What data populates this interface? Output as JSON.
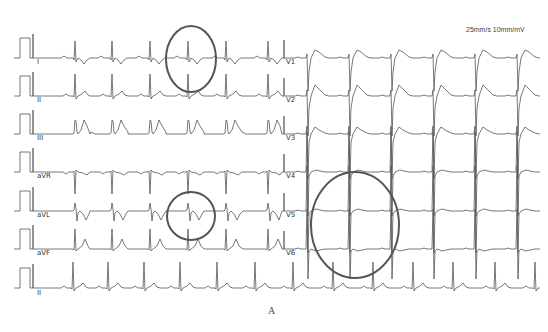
{
  "header": {
    "speed_label": "25mm/s 10mm/mV"
  },
  "figure": {
    "panel_label": "A"
  },
  "colors": {
    "trace": "#555555",
    "circle": "#555555",
    "background": "#ffffff"
  },
  "limb_leads": [
    {
      "name": "I",
      "baseline": 58,
      "label_x": 37,
      "label_y": 62,
      "morph": "I"
    },
    {
      "name": "II",
      "baseline": 96,
      "label_x": 37,
      "label_y": 100,
      "morph": "II"
    },
    {
      "name": "III",
      "baseline": 134,
      "label_x": 37,
      "label_y": 138,
      "morph": "III"
    },
    {
      "name": "aVR",
      "baseline": 172,
      "label_x": 37,
      "label_y": 176,
      "morph": "aVR"
    },
    {
      "name": "aVL",
      "baseline": 211,
      "label_x": 37,
      "label_y": 215,
      "morph": "aVL"
    },
    {
      "name": "aVF",
      "baseline": 249,
      "label_x": 37,
      "label_y": 253,
      "morph": "aVF"
    }
  ],
  "limb_beats_x": [
    75,
    112,
    150,
    188,
    226,
    268
  ],
  "precordial_leads": [
    {
      "name": "V1",
      "baseline": 58,
      "label_x": 286,
      "label_y": 62,
      "morph": "V1"
    },
    {
      "name": "V2",
      "baseline": 96,
      "label_x": 286,
      "label_y": 100,
      "morph": "V2"
    },
    {
      "name": "V3",
      "baseline": 134,
      "label_x": 286,
      "label_y": 138,
      "morph": "V3"
    },
    {
      "name": "V4",
      "baseline": 172,
      "label_x": 286,
      "label_y": 176,
      "morph": "V4"
    },
    {
      "name": "V5",
      "baseline": 211,
      "label_x": 286,
      "label_y": 215,
      "morph": "V5"
    },
    {
      "name": "V6",
      "baseline": 249,
      "label_x": 286,
      "label_y": 253,
      "morph": "V6"
    }
  ],
  "precordial_beats_x": [
    307,
    349,
    391,
    433,
    475,
    517
  ],
  "rhythm_strip": {
    "name": "II",
    "baseline": 288,
    "label_x": 37,
    "label_y": 293,
    "beats_x": [
      73,
      108,
      144,
      180,
      217,
      255,
      293,
      333,
      373,
      413,
      453,
      495,
      535
    ]
  },
  "annotations": [
    {
      "name": "lead-I-circle",
      "cx": 191,
      "cy": 59,
      "rx": 25,
      "ry": 33
    },
    {
      "name": "lead-aVL-circle",
      "cx": 191,
      "cy": 216,
      "rx": 24,
      "ry": 24
    },
    {
      "name": "lead-V5-V6-circle",
      "cx": 355,
      "cy": 225,
      "rx": 44,
      "ry": 53
    }
  ]
}
